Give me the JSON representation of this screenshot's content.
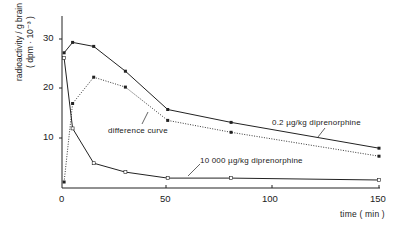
{
  "chart_data": {
    "type": "line",
    "title": "",
    "xlabel": "time ( min )",
    "ylabel": "radioactivity / g brain",
    "ylabel_units": "( dpm · 10⁻³ )",
    "xlim": [
      0,
      150
    ],
    "ylim": [
      0,
      34
    ],
    "xticks": [
      0,
      50,
      100,
      150
    ],
    "yticks": [
      10,
      20,
      30
    ],
    "grid": false,
    "legend": "inline annotations",
    "series": [
      {
        "name": "0.2 µg/kg diprenorphine",
        "style": "solid",
        "marker": "filled-square",
        "x": [
          1,
          5,
          15,
          30,
          50,
          80,
          150
        ],
        "y": [
          27.2,
          29.3,
          28.5,
          23.5,
          15.8,
          13.2,
          8.0
        ]
      },
      {
        "name": "difference curve",
        "style": "dotted",
        "marker": "filled-square",
        "x": [
          1,
          5,
          15,
          30,
          50,
          80,
          150
        ],
        "y": [
          1.2,
          17.0,
          22.3,
          20.3,
          13.6,
          11.2,
          6.4
        ]
      },
      {
        "name": "10 000 µg/kg diprenorphine",
        "style": "solid",
        "marker": "open-square",
        "x": [
          1,
          5,
          15,
          30,
          50,
          80,
          150
        ],
        "y": [
          26.2,
          12.0,
          5.0,
          3.2,
          2.0,
          2.0,
          1.6
        ]
      }
    ],
    "annotations": [
      {
        "text": "0.2 µg/kg diprenorphine",
        "points_to": "upper solid curve"
      },
      {
        "text": "difference curve",
        "points_to": "dotted curve"
      },
      {
        "text": "10 000 µg/kg diprenorphine",
        "points_to": "lower solid curve"
      }
    ]
  },
  "labels": {
    "ylabel_line1": "radioactivity / g brain",
    "ylabel_line2": "( dpm · 10⁻³ )",
    "xlabel": "time ( min )",
    "ann_low_dose": "0.2 µg/kg diprenorphine",
    "ann_diff": "difference curve",
    "ann_high_dose": "10 000 µg/kg diprenorphine",
    "xtick_0": "0",
    "xtick_50": "50",
    "xtick_100": "100",
    "xtick_150": "150",
    "ytick_10": "10",
    "ytick_20": "20",
    "ytick_30": "30"
  }
}
